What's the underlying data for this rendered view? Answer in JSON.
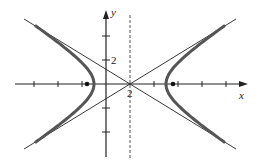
{
  "figure": {
    "type": "hyperbola",
    "equation": "(x-2)^2/9 - y^2/4 = 1",
    "axes": {
      "x_label": "x",
      "y_label": "y",
      "x_tick_label": "2",
      "y_tick_label": "2"
    },
    "center": [
      2,
      0
    ],
    "vertices": [
      [
        -1,
        0
      ],
      [
        5,
        0
      ]
    ],
    "foci_marked": true,
    "asymptotes_drawn": true,
    "dashed_vertical_line_x": 2,
    "colors": {
      "curve": "#555555",
      "lines": "#222222",
      "background": "#ffffff"
    }
  }
}
